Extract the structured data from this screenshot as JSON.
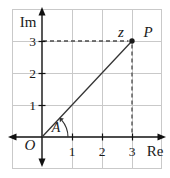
{
  "figure": {
    "type": "argand-diagram",
    "axes": {
      "x_label": "Re",
      "y_label": "Im",
      "x_range": [
        0,
        3
      ],
      "y_range": [
        0,
        3
      ]
    },
    "origin_label": "O",
    "angle_label": "A",
    "point": {
      "label": "P",
      "value_label": "z",
      "re": 3,
      "im": 3
    },
    "x_ticks": [
      "1",
      "2",
      "3"
    ],
    "y_ticks": [
      "1",
      "2",
      "3"
    ],
    "grid": "on",
    "colors": {
      "axis": "#111111",
      "grid_line": "#c9c9c9",
      "dashed_projection": "#4a4a4a",
      "ray": "#333333",
      "point_fill": "#1a1a1a"
    }
  }
}
